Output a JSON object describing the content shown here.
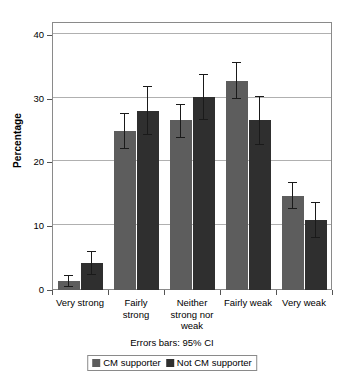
{
  "chart_data": {
    "type": "bar",
    "title": "",
    "subtitle": "",
    "xlabel": "",
    "ylabel": "Percentage",
    "ylim": [
      0,
      42
    ],
    "yticks": [
      0,
      10,
      20,
      30,
      40
    ],
    "ytick_labels": [
      "0",
      "10",
      "20",
      "30",
      "40"
    ],
    "grid": true,
    "grid_axis": "y",
    "legend_position": "bottom-center",
    "annotation": "Errors bars: 95% CI",
    "categories": [
      "Very strong",
      "Fairly strong",
      "Neither strong nor weak",
      "Fairly weak",
      "Very weak"
    ],
    "category_label_lines": [
      [
        "Very strong"
      ],
      [
        "Fairly",
        "strong"
      ],
      [
        "Neither",
        "strong nor",
        "weak"
      ],
      [
        "Fairly weak"
      ],
      [
        "Very weak"
      ]
    ],
    "series": [
      {
        "name": "CM supporter",
        "color": "#5d5d5d",
        "values": [
          1.4,
          24.9,
          26.6,
          32.8,
          14.8
        ],
        "ci_low": [
          0.5,
          22.1,
          23.9,
          30.0,
          12.7
        ],
        "ci_high": [
          2.3,
          27.7,
          29.2,
          35.7,
          17.0
        ]
      },
      {
        "name": "Not CM supporter",
        "color": "#2f2f2f",
        "values": [
          4.3,
          28.1,
          30.2,
          26.6,
          11.0
        ],
        "ci_low": [
          2.4,
          24.3,
          26.6,
          22.7,
          8.2
        ],
        "ci_high": [
          6.1,
          32.0,
          33.9,
          30.4,
          13.8
        ]
      }
    ]
  },
  "legend": {
    "entries": [
      {
        "label": "CM supporter",
        "color": "#5d5d5d"
      },
      {
        "label": "Not CM supporter",
        "color": "#2f2f2f"
      }
    ]
  }
}
